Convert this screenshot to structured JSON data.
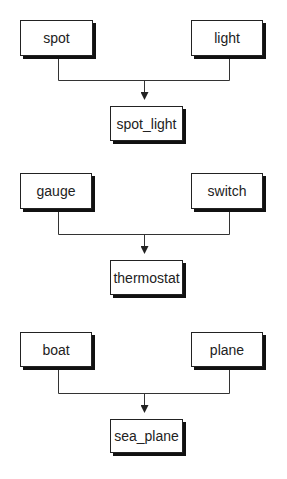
{
  "diagrams": [
    {
      "parents": [
        {
          "label": "spot"
        },
        {
          "label": "light"
        }
      ],
      "child": {
        "label": "spot_light"
      }
    },
    {
      "parents": [
        {
          "label": "gauge"
        },
        {
          "label": "switch"
        }
      ],
      "child": {
        "label": "thermostat"
      }
    },
    {
      "parents": [
        {
          "label": "boat"
        },
        {
          "label": "plane"
        }
      ],
      "child": {
        "label": "sea_plane"
      }
    }
  ],
  "colors": {
    "line": "#333333",
    "box_border": "#222222",
    "shadow": "#111111"
  }
}
